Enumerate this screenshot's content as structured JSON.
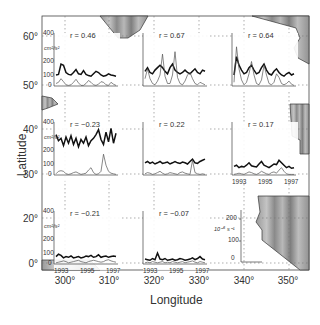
{
  "figure": {
    "xlabel": "Longitude",
    "ylabel": "Latitude",
    "x_ticks": [
      "300°",
      "310°",
      "320°",
      "330°",
      "340°",
      "350°"
    ],
    "y_ticks": [
      "60°",
      "50°",
      "40°",
      "30°",
      "20°",
      "0°"
    ],
    "panel_y_ticks": [
      "400",
      "200",
      "100",
      "0"
    ],
    "panel_unit": "cm²/s²",
    "panel_year_ticks": [
      "1993",
      "1995",
      "1997"
    ],
    "key_y_ticks": [
      "200",
      "100",
      "0"
    ],
    "key_unit": "10⁻⁶ s⁻¹"
  },
  "chart_data": {
    "type": "line",
    "title": "",
    "xlabel": "Longitude",
    "ylabel": "Latitude",
    "xlim": [
      295,
      355
    ],
    "x_ticks": [
      300,
      310,
      320,
      330,
      340,
      350
    ],
    "y_ticks_labels": [
      "0°",
      "20°",
      "30°",
      "40°",
      "50°",
      "60°"
    ],
    "grid": "dotted",
    "panel_axes": {
      "x": "Year (1993–1997)",
      "x_ticks": [
        1993,
        1995,
        1997
      ],
      "y": "Eddy kinetic energy (cm²/s²)",
      "y_ticks": [
        0,
        100,
        200,
        400
      ],
      "secondary_y": "10⁻⁶ s⁻¹",
      "secondary_y_ticks": [
        0,
        100,
        200
      ]
    },
    "panels": [
      {
        "row": 1,
        "col": 1,
        "position": "~50°N, 300–310°E",
        "r": "r = 0.46",
        "r_value": 0.46,
        "series": [
          {
            "name": "thick",
            "values": [
              90,
              95,
              180,
              170,
              110,
              95,
              90,
              110,
              135,
              100,
              95,
              125,
              95,
              85,
              80,
              100,
              120,
              110,
              90,
              80,
              85,
              100,
              90,
              85,
              80
            ]
          },
          {
            "name": "thin",
            "values": [
              20,
              30,
              60,
              35,
              10,
              5,
              10,
              30,
              55,
              25,
              5,
              5,
              20,
              45,
              30,
              10,
              5,
              15,
              35,
              30,
              10,
              5,
              30,
              15,
              5
            ]
          }
        ]
      },
      {
        "row": 1,
        "col": 2,
        "position": "~50°N, 320–330°E",
        "r": "r = 0.67",
        "r_value": 0.67,
        "series": [
          {
            "name": "thick",
            "values": [
              120,
              150,
              110,
              100,
              130,
              150,
              170,
              150,
              120,
              100,
              150,
              180,
              130,
              110,
              100,
              110,
              130,
              110,
              100,
              120,
              140,
              110,
              100,
              130,
              120
            ]
          },
          {
            "name": "thin",
            "values": [
              60,
              140,
              60,
              20,
              10,
              40,
              90,
              260,
              80,
              20,
              20,
              90,
              280,
              70,
              20,
              10,
              40,
              90,
              110,
              60,
              20,
              10,
              30,
              20,
              10
            ]
          }
        ]
      },
      {
        "row": 1,
        "col": 3,
        "position": "~50°N, 338–348°E",
        "r": "r = 0.64",
        "r_value": 0.64,
        "series": [
          {
            "name": "thick",
            "values": [
              90,
              240,
              170,
              130,
              100,
              110,
              150,
              170,
              130,
              100,
              110,
              150,
              180,
              130,
              100,
              90,
              120,
              140,
              110,
              90,
              80,
              100,
              110,
              90,
              100
            ]
          },
          {
            "name": "thin",
            "values": [
              30,
              320,
              140,
              50,
              10,
              30,
              100,
              200,
              90,
              20,
              10,
              50,
              170,
              90,
              20,
              10,
              30,
              100,
              70,
              20,
              10,
              20,
              40,
              15,
              5
            ]
          }
        ]
      },
      {
        "row": 2,
        "col": 1,
        "position": "~35°N, 300–310°E",
        "r": "r = −0.23",
        "r_value": -0.23,
        "series": [
          {
            "name": "thick",
            "values": [
              330,
              280,
              300,
              240,
              310,
              260,
              320,
              250,
              300,
              230,
              290,
              260,
              310,
              240,
              280,
              300,
              330,
              370,
              290,
              250,
              350,
              270,
              380,
              260,
              340
            ]
          },
          {
            "name": "thin",
            "values": [
              10,
              30,
              35,
              30,
              10,
              5,
              10,
              20,
              25,
              15,
              5,
              10,
              15,
              40,
              60,
              20,
              5,
              10,
              30,
              170,
              80,
              30,
              15,
              10,
              5
            ]
          }
        ]
      },
      {
        "row": 2,
        "col": 2,
        "position": "~35°N, 320–330°E",
        "r": "r = 0.22",
        "r_value": 0.22,
        "series": [
          {
            "name": "thick",
            "values": [
              100,
              110,
              95,
              105,
              90,
              100,
              110,
              95,
              100,
              105,
              90,
              100,
              110,
              100,
              95,
              105,
              100,
              90,
              110,
              130,
              100,
              95,
              110,
              120,
              130
            ]
          },
          {
            "name": "thin",
            "values": [
              10,
              20,
              15,
              5,
              10,
              20,
              30,
              15,
              5,
              10,
              20,
              15,
              10,
              5,
              20,
              25,
              15,
              10,
              5,
              120,
              20,
              10,
              5,
              10,
              5
            ]
          }
        ]
      },
      {
        "row": 2,
        "col": 3,
        "position": "~35°N, 338–348°E",
        "r": "r = 0.17",
        "r_value": 0.17,
        "series": [
          {
            "name": "thick",
            "values": [
              70,
              80,
              60,
              70,
              65,
              80,
              100,
              75,
              70,
              65,
              90,
              110,
              80,
              70,
              60,
              75,
              90,
              85,
              120,
              100,
              80,
              60,
              70,
              55,
              60
            ]
          },
          {
            "name": "thin",
            "values": [
              5,
              10,
              15,
              10,
              5,
              15,
              25,
              20,
              10,
              5,
              15,
              30,
              20,
              10,
              5,
              20,
              25,
              15,
              40,
              60,
              30,
              10,
              5,
              5,
              5
            ]
          }
        ]
      },
      {
        "row": 3,
        "col": 1,
        "position": "~10°N, 300–310°E",
        "r": "r = −0.21",
        "r_value": -0.21,
        "series": [
          {
            "name": "thick",
            "values": [
              60,
              80,
              70,
              50,
              60,
              55,
              65,
              50,
              55,
              60,
              50,
              55,
              65,
              60,
              70,
              55,
              60,
              75,
              55,
              60,
              65,
              55,
              60,
              65,
              60
            ]
          },
          {
            "name": "thin",
            "values": [
              10,
              15,
              20,
              25,
              20,
              10,
              15,
              20,
              25,
              30,
              20,
              15,
              10,
              20,
              25,
              30,
              25,
              20,
              15,
              20,
              30,
              35,
              25,
              20,
              15
            ]
          }
        ]
      },
      {
        "row": 3,
        "col": 2,
        "position": "~10°N, 320–330°E",
        "r": "r = −0.07",
        "r_value": -0.07,
        "series": [
          {
            "name": "thick",
            "values": [
              40,
              35,
              30,
              45,
              35,
              90,
              40,
              35,
              45,
              30,
              35,
              40,
              30,
              35,
              45,
              40,
              30,
              35,
              40,
              50,
              35,
              45,
              60,
              40,
              35
            ]
          },
          {
            "name": "thin",
            "values": [
              10,
              15,
              10,
              20,
              15,
              10,
              15,
              20,
              10,
              15,
              10,
              20,
              15,
              10,
              15,
              20,
              10,
              15,
              20,
              25,
              15,
              10,
              20,
              15,
              10
            ]
          }
        ]
      }
    ],
    "key_panel": {
      "position": "~10°N, 338–348°E",
      "y_ticks": [
        0,
        100,
        200
      ],
      "unit": "10⁻⁶ s⁻¹"
    }
  }
}
